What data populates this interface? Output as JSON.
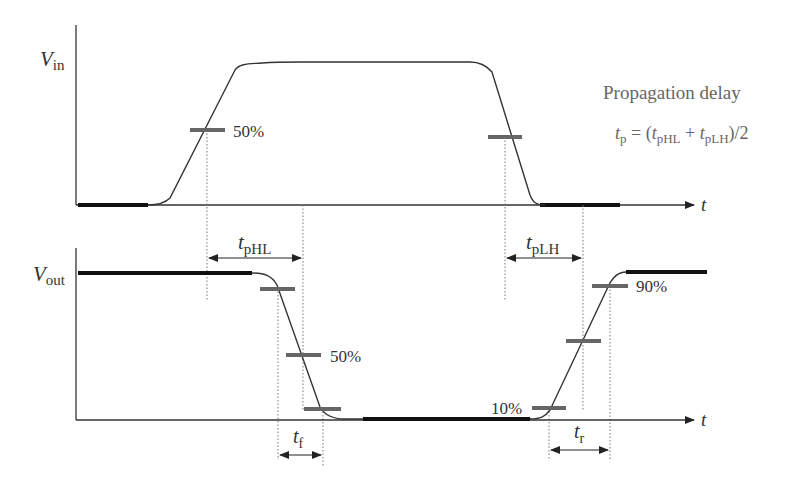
{
  "title": "Propagation delay",
  "formula": {
    "lhs": "t",
    "lhs_sub": "p",
    "eq": " = (",
    "a": "t",
    "a_sub": "pHL",
    "plus": " + ",
    "b": "t",
    "b_sub": "pLH",
    "tail": ")/2"
  },
  "input_plot": {
    "ylabel": "V",
    "ylabel_sub": "in",
    "xlabel": "t",
    "marker_label": "50%"
  },
  "output_plot": {
    "ylabel": "V",
    "ylabel_sub": "out",
    "xlabel": "t",
    "marker_50": "50%",
    "marker_10": "10%",
    "marker_90": "90%"
  },
  "intervals": {
    "tpHL": {
      "main": "t",
      "sub": "pHL"
    },
    "tpLH": {
      "main": "t",
      "sub": "pLH"
    },
    "tf": {
      "main": "t",
      "sub": "f"
    },
    "tr": {
      "main": "t",
      "sub": "r"
    }
  },
  "colors": {
    "line": "#333333",
    "thick": "#111111",
    "marker": "#666666",
    "guide": "#777777"
  }
}
